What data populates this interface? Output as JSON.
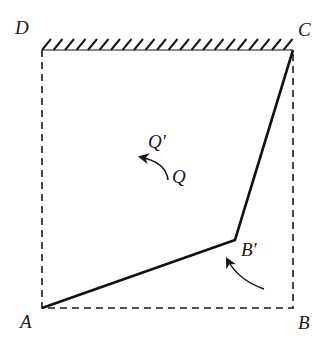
{
  "figure": {
    "labels": {
      "A": "A",
      "B": "B",
      "C": "C",
      "D": "D",
      "B_prime": "B′",
      "Q": "Q",
      "Q_prime": "Q′"
    },
    "colors": {
      "ink": "#1a1a1a",
      "background": "#ffffff"
    },
    "points": {
      "A": [
        42,
        308
      ],
      "B": [
        293,
        308
      ],
      "C": [
        293,
        50
      ],
      "D": [
        42,
        50
      ],
      "B_prime": [
        235,
        240
      ]
    },
    "dash_pattern": [
      7,
      5
    ],
    "hatch_spacing": 11.5,
    "arrows": {
      "B_prime_rotation": {
        "from": [
          264,
          289
        ],
        "control": [
          238,
          280
        ],
        "to": [
          227,
          259
        ]
      },
      "Q_rotation": {
        "from": [
          168,
          180
        ],
        "control": [
          166,
          162
        ],
        "to": [
          140,
          157
        ]
      }
    }
  }
}
